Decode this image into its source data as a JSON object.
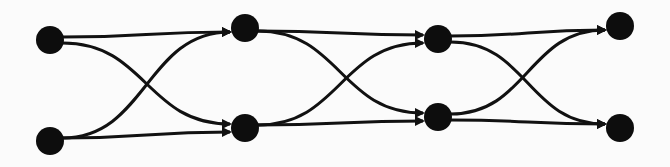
{
  "diagram": {
    "type": "layered-directed-graph",
    "background": "#fbfbfb",
    "ink_color": "#111111",
    "node_radius": 14,
    "layers": 4,
    "nodes": [
      {
        "id": "a0",
        "layer": 0,
        "x": 50,
        "y": 40
      },
      {
        "id": "b0",
        "layer": 0,
        "x": 50,
        "y": 141
      },
      {
        "id": "a1",
        "layer": 1,
        "x": 245,
        "y": 28
      },
      {
        "id": "b1",
        "layer": 1,
        "x": 245,
        "y": 128
      },
      {
        "id": "a2",
        "layer": 2,
        "x": 438,
        "y": 39
      },
      {
        "id": "b2",
        "layer": 2,
        "x": 438,
        "y": 117
      },
      {
        "id": "a3",
        "layer": 3,
        "x": 620,
        "y": 26
      },
      {
        "id": "b3",
        "layer": 3,
        "x": 620,
        "y": 128
      }
    ],
    "edges": [
      {
        "from": "a0",
        "to": "a1"
      },
      {
        "from": "a0",
        "to": "b1"
      },
      {
        "from": "b0",
        "to": "a1"
      },
      {
        "from": "b0",
        "to": "b1"
      },
      {
        "from": "a1",
        "to": "a2"
      },
      {
        "from": "a1",
        "to": "b2"
      },
      {
        "from": "b1",
        "to": "a2"
      },
      {
        "from": "b1",
        "to": "b2"
      },
      {
        "from": "a2",
        "to": "a3"
      },
      {
        "from": "a2",
        "to": "b3"
      },
      {
        "from": "b2",
        "to": "a3"
      },
      {
        "from": "b2",
        "to": "b3"
      }
    ]
  }
}
